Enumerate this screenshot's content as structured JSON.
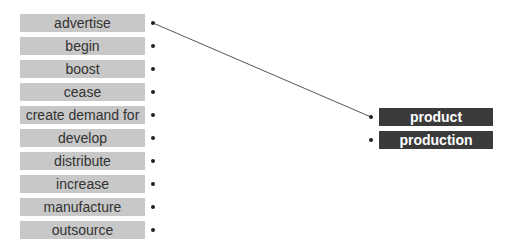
{
  "left_items": [
    {
      "label": "advertise"
    },
    {
      "label": "begin"
    },
    {
      "label": "boost"
    },
    {
      "label": "cease"
    },
    {
      "label": "create demand for"
    },
    {
      "label": "develop"
    },
    {
      "label": "distribute"
    },
    {
      "label": "increase"
    },
    {
      "label": "manufacture"
    },
    {
      "label": "outsource"
    }
  ],
  "right_items": [
    {
      "label": "product"
    },
    {
      "label": "production"
    }
  ],
  "connections": [
    {
      "from": "advertise",
      "to": "product"
    }
  ],
  "colors": {
    "left_box": "#c8c8c8",
    "right_box": "#3a3a3a",
    "line": "#555555"
  }
}
